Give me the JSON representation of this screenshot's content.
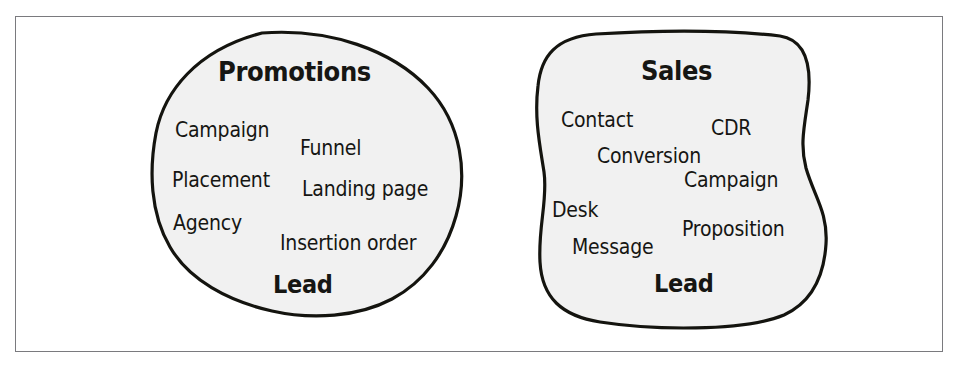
{
  "figure": {
    "name": "domain-term-clusters",
    "frame_border_color": "#7a7a7e",
    "blob_fill_color": "#f1f1f1",
    "blob_stroke_color": "#14140f",
    "text_color": "#161613"
  },
  "clusters": [
    {
      "id": "promotions",
      "title": "Promotions",
      "shared_term": "Lead",
      "terms": [
        {
          "label": "Campaign",
          "x": 175,
          "y": 120
        },
        {
          "label": "Funnel",
          "x": 300,
          "y": 138
        },
        {
          "label": "Placement",
          "x": 172,
          "y": 170
        },
        {
          "label": "Landing page",
          "x": 302,
          "y": 179
        },
        {
          "label": "Agency",
          "x": 173,
          "y": 213
        },
        {
          "label": "Insertion order",
          "x": 280,
          "y": 233
        }
      ]
    },
    {
      "id": "sales",
      "title": "Sales",
      "shared_term": "Lead",
      "terms": [
        {
          "label": "Contact",
          "x": 561,
          "y": 110
        },
        {
          "label": "CDR",
          "x": 711,
          "y": 118
        },
        {
          "label": "Conversion",
          "x": 597,
          "y": 146
        },
        {
          "label": "Campaign",
          "x": 684,
          "y": 170
        },
        {
          "label": "Desk",
          "x": 552,
          "y": 200
        },
        {
          "label": "Proposition",
          "x": 682,
          "y": 219
        },
        {
          "label": "Message",
          "x": 572,
          "y": 237
        }
      ]
    }
  ]
}
